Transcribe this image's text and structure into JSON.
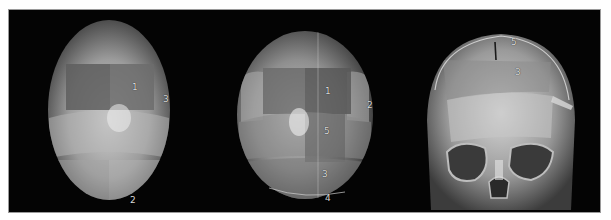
{
  "figure": {
    "panels": [
      {
        "name": "top-view-left",
        "labels": [
          {
            "id": "seg1",
            "text": "1"
          },
          {
            "id": "seg3",
            "text": "3"
          },
          {
            "id": "seg2",
            "text": "2"
          }
        ]
      },
      {
        "name": "top-view-center",
        "labels": [
          {
            "id": "seg1",
            "text": "1"
          },
          {
            "id": "seg2",
            "text": "2"
          },
          {
            "id": "seg5",
            "text": "5"
          },
          {
            "id": "seg3",
            "text": "3"
          },
          {
            "id": "seg4",
            "text": "4"
          }
        ]
      },
      {
        "name": "frontal-view-right",
        "labels": [
          {
            "id": "seg5",
            "text": "5"
          },
          {
            "id": "seg3",
            "text": "3"
          }
        ]
      }
    ]
  },
  "colors": {
    "background": "#040404",
    "skull_light": "#bcbcbc",
    "skull_mid": "#8e8e8e",
    "skull_dark": "#5a5a5a",
    "label": "#d8d8d8"
  }
}
